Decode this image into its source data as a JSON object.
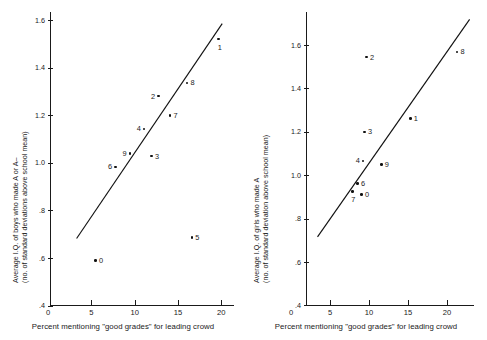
{
  "figure": {
    "background": "#ffffff",
    "ink": "#111111",
    "panel_count": 2
  },
  "chart_data": [
    {
      "type": "scatter",
      "panel": "left",
      "title": "",
      "xlabel": "Percent mentioning \"good grades\" for leading crowd",
      "ylabel": "Average I.Q. of boys who made A or A–",
      "ylabel_line2": "(no. of standard deviations above school mean)",
      "xlim": [
        0,
        21.5
      ],
      "ylim": [
        0.4,
        1.68
      ],
      "xticks": [
        0,
        5,
        10,
        15,
        20
      ],
      "xticklabels": [
        "0",
        "5",
        "10",
        "15",
        "20"
      ],
      "yticks": [
        0.4,
        0.6,
        0.8,
        1.0,
        1.2,
        1.4,
        1.6
      ],
      "yticklabels": [
        ".4",
        ".6",
        ".8",
        "1.0",
        "1.2",
        "1.4",
        "1.6"
      ],
      "grid": false,
      "legend": "none",
      "points": [
        {
          "label": "0",
          "x": 5.5,
          "y": 0.59,
          "label_side": "right"
        },
        {
          "label": "6",
          "x": 7.8,
          "y": 0.982,
          "label_side": "left"
        },
        {
          "label": "9",
          "x": 9.45,
          "y": 1.04,
          "label_side": "left"
        },
        {
          "label": "4",
          "x": 11.1,
          "y": 1.142,
          "label_side": "left"
        },
        {
          "label": "3",
          "x": 11.95,
          "y": 1.028,
          "label_side": "right"
        },
        {
          "label": "2",
          "x": 12.75,
          "y": 1.28,
          "label_side": "left"
        },
        {
          "label": "7",
          "x": 14.1,
          "y": 1.198,
          "label_side": "right"
        },
        {
          "label": "8",
          "x": 16.05,
          "y": 1.336,
          "label_side": "right"
        },
        {
          "label": "5",
          "x": 16.6,
          "y": 0.686,
          "label_side": "right"
        },
        {
          "label": "1",
          "x": 19.7,
          "y": 1.52,
          "label_side": "below"
        }
      ],
      "fit_line": {
        "x1": 3.3,
        "y1": 0.682,
        "x2": 20.1,
        "y2": 1.585
      }
    },
    {
      "type": "scatter",
      "panel": "right",
      "title": "",
      "xlabel": "Percent mentioning \"good grades\" for leading crowd",
      "ylabel": "Average I.Q. of girls who made A",
      "ylabel_line2": "(no. of standard deviation above school mean)",
      "xlim": [
        0,
        23.5
      ],
      "ylim": [
        0.4,
        1.74
      ],
      "xticks": [
        0,
        5,
        10,
        15,
        20
      ],
      "xticklabels": [
        "0",
        "5",
        "10",
        "15",
        "20"
      ],
      "yticks": [
        0.4,
        0.6,
        0.8,
        1.0,
        1.2,
        1.4,
        1.6
      ],
      "yticklabels": [
        ".4",
        ".6",
        ".8",
        "1.0",
        "1.2",
        "1.4",
        "1.6"
      ],
      "grid": false,
      "legend": "none",
      "points": [
        {
          "label": "7",
          "x": 7.85,
          "y": 0.925,
          "label_side": "below"
        },
        {
          "label": "6",
          "x": 8.55,
          "y": 0.962,
          "label_side": "right"
        },
        {
          "label": "0",
          "x": 9.05,
          "y": 0.912,
          "label_side": "right"
        },
        {
          "label": "4",
          "x": 9.25,
          "y": 1.066,
          "label_side": "left"
        },
        {
          "label": "3",
          "x": 9.45,
          "y": 1.2,
          "label_side": "right"
        },
        {
          "label": "2",
          "x": 9.7,
          "y": 1.544,
          "label_side": "right"
        },
        {
          "label": "9",
          "x": 11.6,
          "y": 1.05,
          "label_side": "right"
        },
        {
          "label": "1",
          "x": 15.3,
          "y": 1.262,
          "label_side": "right"
        },
        {
          "label": "8",
          "x": 21.3,
          "y": 1.568,
          "label_side": "right"
        }
      ],
      "fit_line": {
        "x1": 3.4,
        "y1": 0.716,
        "x2": 22.9,
        "y2": 1.718
      }
    }
  ]
}
